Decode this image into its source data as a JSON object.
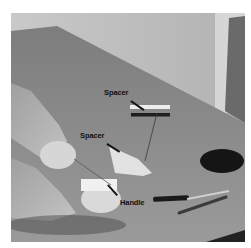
{
  "figure": {
    "labels": [
      {
        "id": "spacer-top",
        "text": "Spacer"
      },
      {
        "id": "spacer-middle",
        "text": "Spacer"
      },
      {
        "id": "handle",
        "text": "Handle"
      }
    ]
  },
  "colors": {
    "background": "#ffffff",
    "wall": "#bdbdbd",
    "table": "#8c8c8c",
    "label_text": "#111111"
  }
}
